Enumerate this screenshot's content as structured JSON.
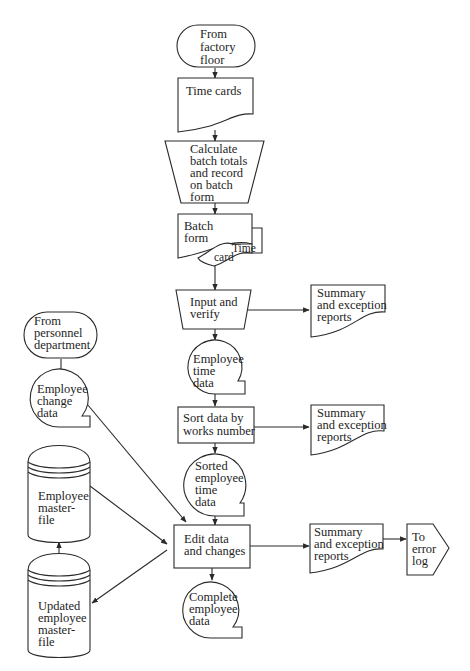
{
  "diagram": {
    "type": "system flowchart",
    "nodes": {
      "factory_floor": {
        "shape": "terminator",
        "lines": [
          "From",
          "factory",
          "floor"
        ]
      },
      "time_cards": {
        "shape": "document",
        "lines": [
          "Time cards"
        ]
      },
      "calc_batch": {
        "shape": "manual-operation",
        "lines": [
          "Calculate",
          "batch totals",
          "and record",
          "on batch",
          "form"
        ]
      },
      "batch_form": {
        "shape": "multi-document",
        "lines": [
          "Batch",
          "form"
        ],
        "overlay_lines": [
          "Time",
          "card"
        ]
      },
      "input_verify": {
        "shape": "manual-operation",
        "lines": [
          "Input and",
          "verify"
        ]
      },
      "report1": {
        "shape": "document",
        "lines": [
          "Summary",
          "and exception",
          "reports"
        ]
      },
      "emp_time_data": {
        "shape": "magnetic-tape",
        "lines": [
          "Employee",
          "time",
          "data"
        ]
      },
      "sort": {
        "shape": "process",
        "lines": [
          "Sort data by",
          "works number"
        ]
      },
      "report2": {
        "shape": "document",
        "lines": [
          "Summary",
          "and exception",
          "reports"
        ]
      },
      "sorted_data": {
        "shape": "magnetic-tape",
        "lines": [
          "Sorted",
          "employee",
          "time",
          "data"
        ]
      },
      "personnel": {
        "shape": "terminator",
        "lines": [
          "From",
          "personnel",
          "department"
        ]
      },
      "emp_change": {
        "shape": "magnetic-tape",
        "lines": [
          "Employee",
          "change",
          "data"
        ]
      },
      "master_file": {
        "shape": "disk-storage",
        "lines": [
          "Employee",
          "master-",
          "file"
        ]
      },
      "edit": {
        "shape": "process",
        "lines": [
          "Edit data",
          "and changes"
        ]
      },
      "report3": {
        "shape": "document",
        "lines": [
          "Summary",
          "and exception",
          "reports"
        ]
      },
      "error_log": {
        "shape": "off-page-connector",
        "lines": [
          "To",
          "error",
          "log"
        ]
      },
      "updated_master": {
        "shape": "disk-storage",
        "lines": [
          "Updated",
          "employee",
          "master-",
          "file"
        ]
      },
      "complete_data": {
        "shape": "magnetic-tape",
        "lines": [
          "Complete",
          "employee",
          "data"
        ]
      }
    },
    "edges": [
      [
        "factory_floor",
        "time_cards"
      ],
      [
        "time_cards",
        "calc_batch"
      ],
      [
        "calc_batch",
        "batch_form"
      ],
      [
        "batch_form",
        "input_verify"
      ],
      [
        "input_verify",
        "report1"
      ],
      [
        "input_verify",
        "emp_time_data"
      ],
      [
        "emp_time_data",
        "sort"
      ],
      [
        "sort",
        "report2"
      ],
      [
        "sort",
        "sorted_data"
      ],
      [
        "sorted_data",
        "edit"
      ],
      [
        "personnel",
        "emp_change"
      ],
      [
        "emp_change",
        "edit"
      ],
      [
        "master_file",
        "edit"
      ],
      [
        "edit",
        "updated_master"
      ],
      [
        "updated_master",
        "master_file"
      ],
      [
        "edit",
        "report3"
      ],
      [
        "report3",
        "error_log"
      ],
      [
        "edit",
        "complete_data"
      ]
    ],
    "stroke_color": "#2a2a2a",
    "background": "#ffffff"
  }
}
